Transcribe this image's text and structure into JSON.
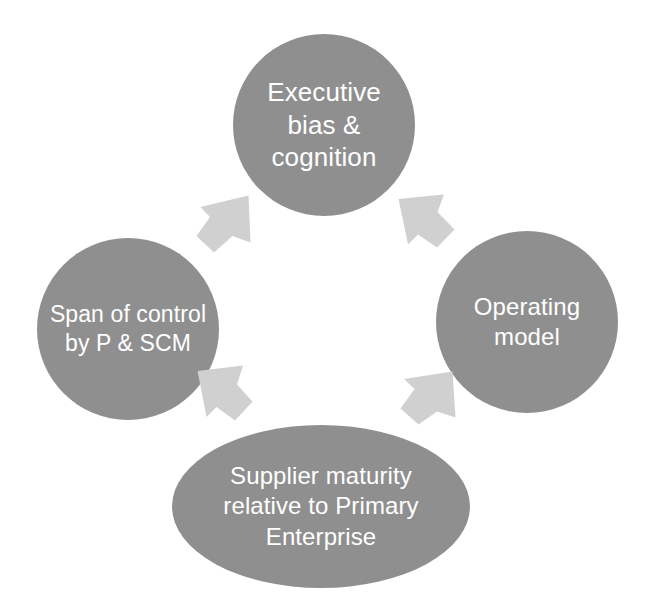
{
  "diagram": {
    "type": "cycle",
    "direction": "counter-clockwise",
    "background_color": "#ffffff",
    "node_fill_color": "#8f8f8f",
    "node_text_color": "#ffffff",
    "arrow_fill_color": "#d0d0d0",
    "nodes": [
      {
        "id": "executive",
        "shape": "circle",
        "position": "top",
        "text": "Executive bias & cognition",
        "lines": [
          "Executive",
          "bias &",
          "cognition"
        ]
      },
      {
        "id": "operating",
        "shape": "circle",
        "position": "right",
        "text": "Operating model",
        "lines": [
          "Operating",
          "model"
        ]
      },
      {
        "id": "supplier",
        "shape": "ellipse",
        "position": "bottom",
        "text": "Supplier maturity relative to Primary Enterprise",
        "lines": [
          "Supplier maturity",
          "relative to",
          "Primary",
          "Enterprise"
        ]
      },
      {
        "id": "span",
        "shape": "circle",
        "position": "left",
        "text": "Span of control by P & SCM",
        "lines": [
          "Span of",
          "control by",
          "P & SCM"
        ]
      }
    ],
    "arrows": [
      {
        "id": "arrow-span-to-executive",
        "from": "span",
        "to": "executive",
        "direction": "up-right"
      },
      {
        "id": "arrow-executive-to-operating",
        "from": "executive",
        "to": "operating",
        "direction": "down-right"
      },
      {
        "id": "arrow-operating-to-supplier",
        "from": "operating",
        "to": "supplier",
        "direction": "down-left"
      },
      {
        "id": "arrow-supplier-to-span",
        "from": "supplier",
        "to": "span",
        "direction": "up-left"
      }
    ]
  }
}
